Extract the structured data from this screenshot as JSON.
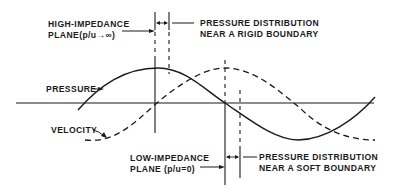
{
  "figure": {
    "labels": {
      "high_impedance": {
        "line1": "HIGH-IMPEDANCE",
        "line2": "PLANE(p/u→∞)"
      },
      "rigid_boundary": {
        "line1": "PRESSURE DISTRIBUTION",
        "line2": "NEAR A RIGID BOUNDARY"
      },
      "pressure": "PRESSURE",
      "velocity": "VELOCITY",
      "low_impedance": {
        "line1": "LOW-IMPEDANCE",
        "line2": "PLANE (p/u=0)"
      },
      "soft_boundary": {
        "line1": "PRESSURE DISTRIBUTION",
        "line2": "NEAR A SOFT BOUNDARY"
      }
    },
    "series": [
      {
        "name": "PRESSURE",
        "style": "solid",
        "phase": "peak at high-impedance plane"
      },
      {
        "name": "VELOCITY",
        "style": "dashed",
        "phase": "zero at high-impedance plane"
      }
    ],
    "colors": {
      "ink": "#1a1a1a",
      "background": "#ffffff"
    }
  }
}
